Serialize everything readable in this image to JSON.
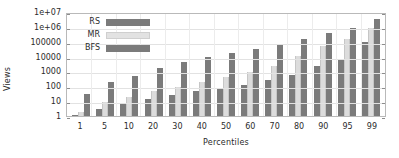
{
  "chart_data": {
    "type": "bar",
    "title": "",
    "xlabel": "Percentiles",
    "ylabel": "Views",
    "yscale": "log",
    "ylim": [
      1,
      10000000
    ],
    "grid": true,
    "legend_position": "top-left",
    "ytick_labels": [
      "1e+07",
      "1e+06",
      "100000",
      "10000",
      "1000",
      "100",
      "10",
      "1"
    ],
    "ytick_values": [
      10000000,
      1000000,
      100000,
      10000,
      1000,
      100,
      10,
      1
    ],
    "categories": [
      "1",
      "5",
      "10",
      "20",
      "30",
      "40",
      "50",
      "60",
      "70",
      "80",
      "90",
      "95",
      "99"
    ],
    "series": [
      {
        "name": "RS",
        "color": "#7b7b7b",
        "values": [
          1,
          3,
          7,
          15,
          27,
          48,
          78,
          130,
          250,
          570,
          2200,
          7200,
          100000
        ]
      },
      {
        "name": "MR",
        "color": "#dcdcdc",
        "values": [
          2,
          9,
          18,
          46,
          95,
          210,
          420,
          950,
          2400,
          11000,
          50000,
          150000,
          850000
        ]
      },
      {
        "name": "BFS",
        "color": "#7b7b7b",
        "values": [
          32,
          185,
          480,
          1700,
          4000,
          8800,
          18000,
          34000,
          68000,
          150000,
          380000,
          830000,
          3300000
        ]
      }
    ]
  },
  "legend": {
    "items": [
      {
        "label": "RS"
      },
      {
        "label": "MR"
      },
      {
        "label": "BFS"
      }
    ]
  }
}
